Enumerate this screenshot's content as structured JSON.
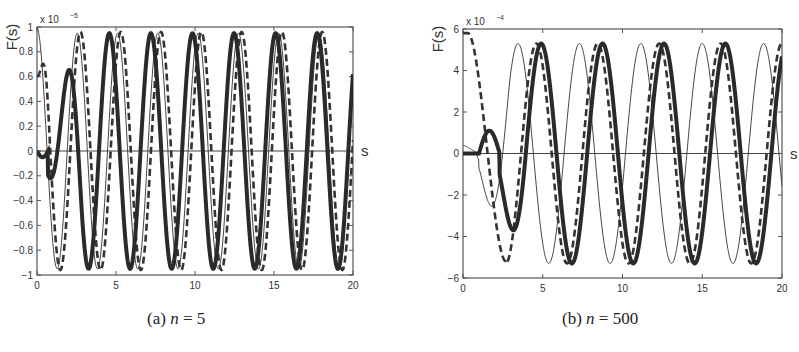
{
  "chart_data": [
    {
      "type": "line",
      "caption": "(a) n = 5",
      "caption_prefix": "(a)",
      "caption_var": "n",
      "caption_value": "= 5",
      "ylabel": "F(s)",
      "xlabel": "s",
      "y_multiplier": "x 10",
      "y_exponent": "-5",
      "xlim": [
        0,
        20
      ],
      "ylim": [
        -1,
        1
      ],
      "xticks": [
        0,
        5,
        10,
        15,
        20
      ],
      "yticks": [
        -1,
        -0.8,
        -0.6,
        -0.4,
        -0.2,
        0,
        0.2,
        0.4,
        0.6,
        0.8,
        1
      ],
      "ytick_labels": [
        "-1",
        "-0.8",
        "-0.6",
        "-0.4",
        "-0.2",
        "0",
        "0.2",
        "0.4",
        "0.6",
        "0.8",
        "1"
      ],
      "grid": false,
      "series": [
        {
          "name": "thin-solid",
          "style": "thin",
          "amplitude": 0.95,
          "omega": 4.0,
          "phase": 1.57,
          "start_value": 1.0,
          "description": "starts at 1, decays to -0.93 near s=1.8, then oscillates ~±0.95"
        },
        {
          "name": "dashed",
          "style": "dashed",
          "amplitude": 0.96,
          "omega": 4.0,
          "phase": 1.35,
          "start_value": 0.6
        },
        {
          "name": "thick-solid",
          "style": "thick",
          "amplitude": 0.95,
          "omega": 4.0,
          "phase": 0.3,
          "start_value": 0.0,
          "description": "small bump 0.32 at s≈1.9, min -0.7 at s≈2.8, then ±0.95"
        }
      ],
      "key_points": {
        "thick_first_peak": [
          1.9,
          0.32
        ],
        "thick_first_trough": [
          2.8,
          -0.7
        ],
        "thin_first_trough": [
          1.7,
          -0.93
        ]
      }
    },
    {
      "type": "line",
      "caption": "(b) n = 500",
      "caption_prefix": "(b)",
      "caption_var": "n",
      "caption_value": "= 500",
      "ylabel": "F(s)",
      "xlabel": "s",
      "y_multiplier": "x 10",
      "y_exponent": "-4",
      "xlim": [
        0,
        20
      ],
      "ylim": [
        -6,
        6
      ],
      "xticks": [
        0,
        5,
        10,
        15,
        20
      ],
      "yticks": [
        -6,
        -4,
        -2,
        0,
        2,
        4,
        6
      ],
      "ytick_labels": [
        "-6",
        "-4",
        "-2",
        "0",
        "2",
        "4",
        "6"
      ],
      "grid": false,
      "series": [
        {
          "name": "thin-solid",
          "style": "thin",
          "amplitude": 5.3,
          "omega": 1.62,
          "phase": 0.0,
          "start_value": 0.4,
          "description": "small 0.4 bump, trough -2.6 at s≈1.7, peak 4.7 at s≈3.4, then ±5.3"
        },
        {
          "name": "dashed",
          "style": "dashed",
          "amplitude": 5.3,
          "omega": 1.62,
          "phase": 0.0,
          "start_value": 5.8,
          "description": "starts near 5.8, trough -5.2 at s≈2.7, then ±5.3"
        },
        {
          "name": "thick-solid",
          "style": "thick",
          "amplitude": 5.3,
          "omega": 1.62,
          "phase": 0.0,
          "start_value": 0.0,
          "description": "flat 0 until s≈1, bump 1.1 at s≈1.7, trough -3.9 at s≈3, peak 5.1 at s≈4.9, then ±5.3"
        }
      ],
      "key_points": {
        "thick_first_peak": [
          1.7,
          1.1
        ],
        "thick_first_trough": [
          3.0,
          -3.9
        ],
        "dashed_first_trough": [
          2.7,
          -5.2
        ],
        "thin_first_trough": [
          1.7,
          -2.6
        ],
        "thin_first_peak": [
          3.4,
          4.7
        ]
      }
    }
  ]
}
